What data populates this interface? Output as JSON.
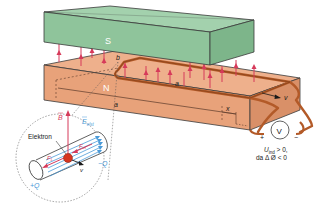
{
  "diagram": {
    "magnet_top_label": "S",
    "magnet_bottom_label": "N",
    "dimension_labels": {
      "b": "b",
      "a_top": "a",
      "a_front": "a",
      "x": "x"
    },
    "velocity_label": "v",
    "voltmeter_label": "V",
    "voltmeter_plus": "+",
    "voltmeter_minus": "−",
    "induced_voltage_line1": "U",
    "induced_voltage_sub": "ind",
    "induced_voltage_rest": " > 0,",
    "induced_voltage_line2": "da Δ Ø < 0",
    "inset": {
      "electron_label": "Elektron",
      "b_field_label": "B",
      "e_field_label": "E",
      "e_field_sub": "elst",
      "force_lorentz_label": "F",
      "force_lorentz_sub": "L",
      "force_electric_label": "F",
      "force_electric_sub": "el",
      "velocity_label": "v",
      "charge_plus": "+Q",
      "charge_minus": "−Q"
    },
    "colors": {
      "magnet_s": "#8fc49b",
      "magnet_s_top": "#a3d1ad",
      "magnet_n": "#e8a27a",
      "magnet_n_top": "#eeb08c",
      "field_lines": "#d63a5a",
      "wire": "#b35a28",
      "e_field": "#4a9ad8",
      "electron": "#d6351f",
      "outline": "#3a3a3a"
    }
  }
}
